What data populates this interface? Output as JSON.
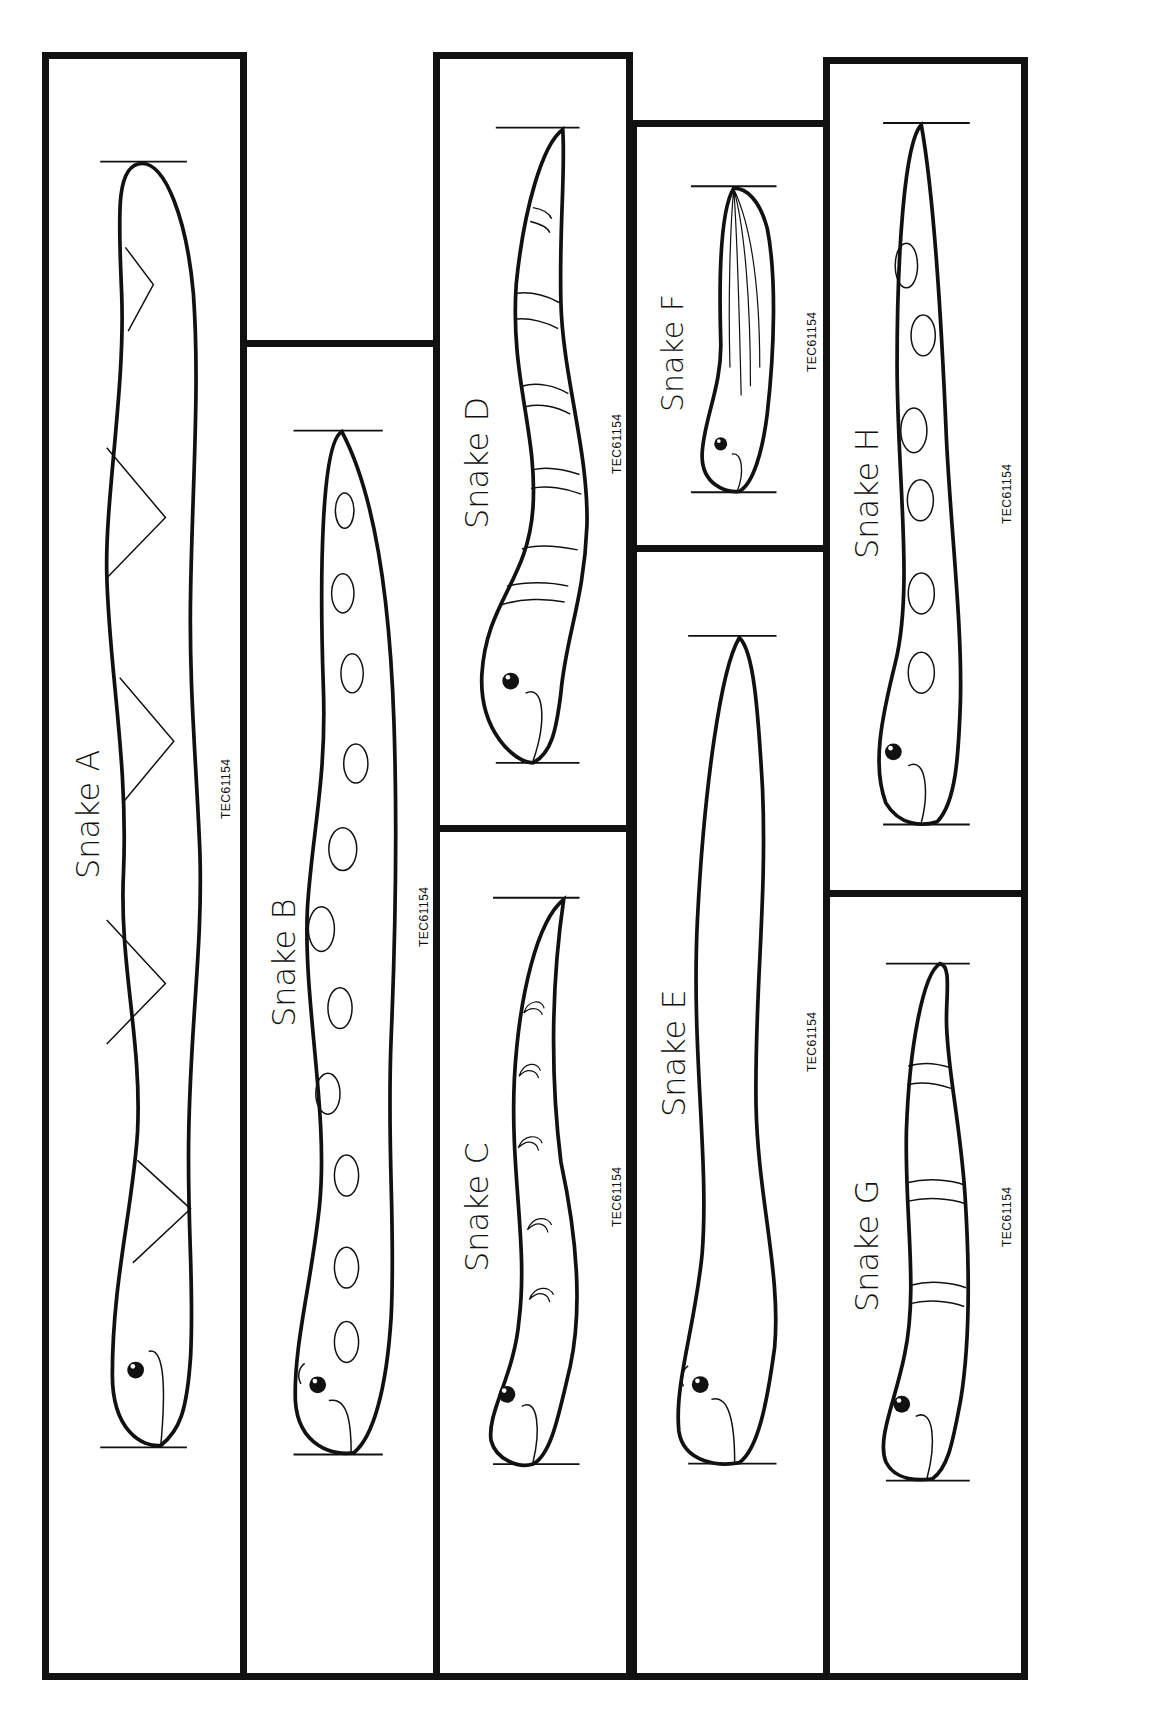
{
  "worksheet": {
    "product_code": "TEC61154",
    "snakes": [
      {
        "id": "A",
        "label": "Snake A",
        "pattern": "triangles",
        "code": "TEC61154"
      },
      {
        "id": "B",
        "label": "Snake B",
        "pattern": "ovals",
        "code": "TEC61154"
      },
      {
        "id": "C",
        "label": "Snake C",
        "pattern": "scales",
        "code": "TEC61154"
      },
      {
        "id": "D",
        "label": "Snake D",
        "pattern": "bands",
        "code": "TEC61154"
      },
      {
        "id": "E",
        "label": "Snake E",
        "pattern": "plain",
        "code": "TEC61154"
      },
      {
        "id": "F",
        "label": "Snake F",
        "pattern": "stripes",
        "code": "TEC61154"
      },
      {
        "id": "G",
        "label": "Snake G",
        "pattern": "bands",
        "code": "TEC61154"
      },
      {
        "id": "H",
        "label": "Snake H",
        "pattern": "ovals",
        "code": "TEC61154"
      }
    ]
  }
}
